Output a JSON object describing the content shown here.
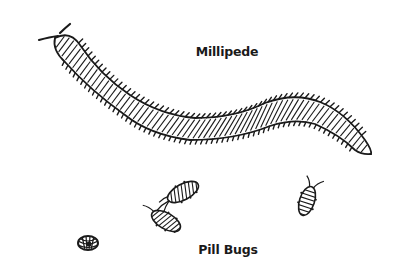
{
  "labels": {
    "millipede": "Millipede",
    "pill_bugs": "Pill Bugs"
  },
  "colors": {
    "background": "#ffffff",
    "ink": "#1a1a1a"
  },
  "figures": [
    {
      "name": "millipede",
      "icon": "millipede-drawing"
    },
    {
      "name": "pill-bug-1",
      "icon": "pill-bug-drawing"
    },
    {
      "name": "pill-bug-2",
      "icon": "pill-bug-drawing"
    },
    {
      "name": "pill-bug-3",
      "icon": "pill-bug-drawing"
    },
    {
      "name": "pill-bug-curled",
      "icon": "curled-pill-bug-drawing"
    }
  ]
}
